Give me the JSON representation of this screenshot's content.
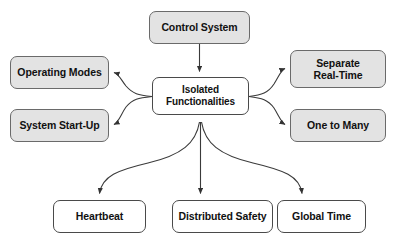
{
  "diagram": {
    "title": "Isolated Functionalities",
    "type": "node-link-diagram",
    "canvas": {
      "width": 395,
      "height": 242,
      "background": "#ffffff"
    },
    "style": {
      "filled_node_color": "#e3e3e3",
      "plain_node_color": "#ffffff",
      "stroke_color": "#5b5b5b",
      "text_color": "#111111"
    },
    "nodes": [
      {
        "id": "control-system",
        "label": "Control System",
        "fill": "filled",
        "role": "source"
      },
      {
        "id": "isolated-functionalities",
        "label": "Isolated\nFunctionalities",
        "fill": "plain",
        "role": "hub"
      },
      {
        "id": "operating-modes",
        "label": "Operating Modes",
        "fill": "filled",
        "role": "left-branch"
      },
      {
        "id": "system-start-up",
        "label": "System Start-Up",
        "fill": "filled",
        "role": "left-branch"
      },
      {
        "id": "separate-real-time",
        "label": "Separate\nReal-Time",
        "fill": "filled",
        "role": "right-branch"
      },
      {
        "id": "one-to-many",
        "label": "One to Many",
        "fill": "filled",
        "role": "right-branch"
      },
      {
        "id": "heartbeat",
        "label": "Heartbeat",
        "fill": "plain",
        "role": "bottom-branch"
      },
      {
        "id": "distributed-safety",
        "label": "Distributed Safety",
        "fill": "plain",
        "role": "bottom-branch"
      },
      {
        "id": "global-time",
        "label": "Global Time",
        "fill": "plain",
        "role": "bottom-branch"
      }
    ],
    "edges": [
      {
        "from": "control-system",
        "to": "isolated-functionalities",
        "shape": "straight",
        "arrow": "to"
      },
      {
        "from": "isolated-functionalities",
        "to": "operating-modes",
        "shape": "curve",
        "arrow": "to"
      },
      {
        "from": "isolated-functionalities",
        "to": "system-start-up",
        "shape": "curve",
        "arrow": "to"
      },
      {
        "from": "isolated-functionalities",
        "to": "separate-real-time",
        "shape": "curve",
        "arrow": "to"
      },
      {
        "from": "isolated-functionalities",
        "to": "one-to-many",
        "shape": "curve",
        "arrow": "to"
      },
      {
        "from": "isolated-functionalities",
        "to": "heartbeat",
        "shape": "curve",
        "arrow": "to"
      },
      {
        "from": "isolated-functionalities",
        "to": "distributed-safety",
        "shape": "straight",
        "arrow": "to"
      },
      {
        "from": "isolated-functionalities",
        "to": "global-time",
        "shape": "curve",
        "arrow": "to"
      }
    ]
  }
}
